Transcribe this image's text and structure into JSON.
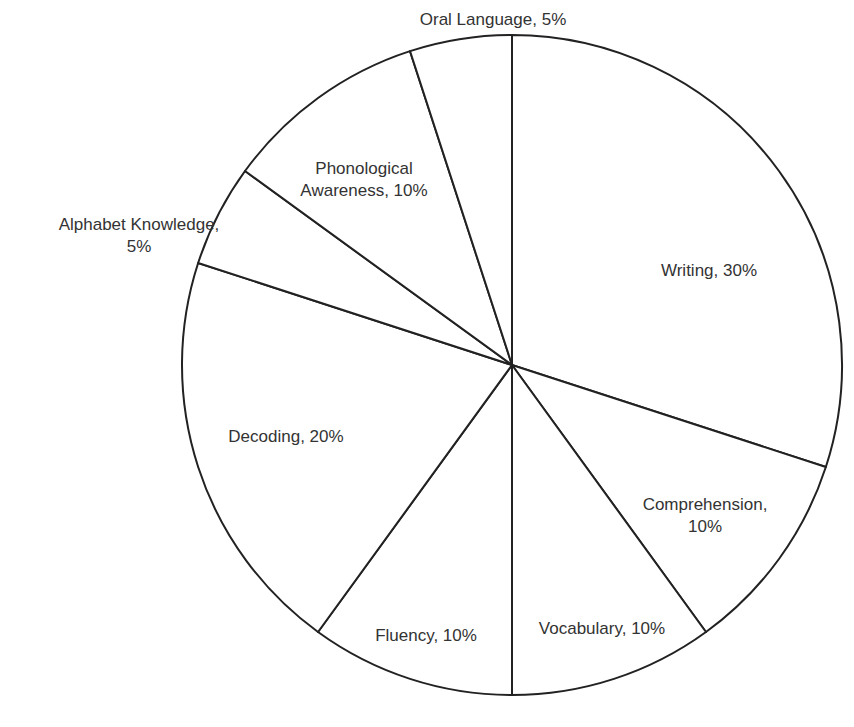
{
  "chart_data": {
    "type": "pie",
    "title": "",
    "start_angle": "12 o'clock",
    "direction": "clockwise",
    "categories": [
      "Writing",
      "Comprehension",
      "Vocabulary",
      "Fluency",
      "Decoding",
      "Alphabet Knowledge",
      "Phonological Awareness",
      "Oral Language"
    ],
    "values": [
      30,
      10,
      10,
      10,
      20,
      5,
      10,
      5
    ],
    "labels": [
      {
        "line1": "Writing, 30%",
        "line2": ""
      },
      {
        "line1": "Comprehension,",
        "line2": "10%"
      },
      {
        "line1": "Vocabulary, 10%",
        "line2": ""
      },
      {
        "line1": "Fluency, 10%",
        "line2": ""
      },
      {
        "line1": "Decoding, 20%",
        "line2": ""
      },
      {
        "line1": "Alphabet Knowledge,",
        "line2": "5%"
      },
      {
        "line1": "Phonological",
        "line2": "Awareness, 10%"
      },
      {
        "line1": "Oral Language, 5%",
        "line2": ""
      }
    ],
    "colors": {
      "fill": "#ffffff",
      "stroke": "#222222",
      "text": "#333333"
    },
    "legend": "none",
    "grid": false
  }
}
